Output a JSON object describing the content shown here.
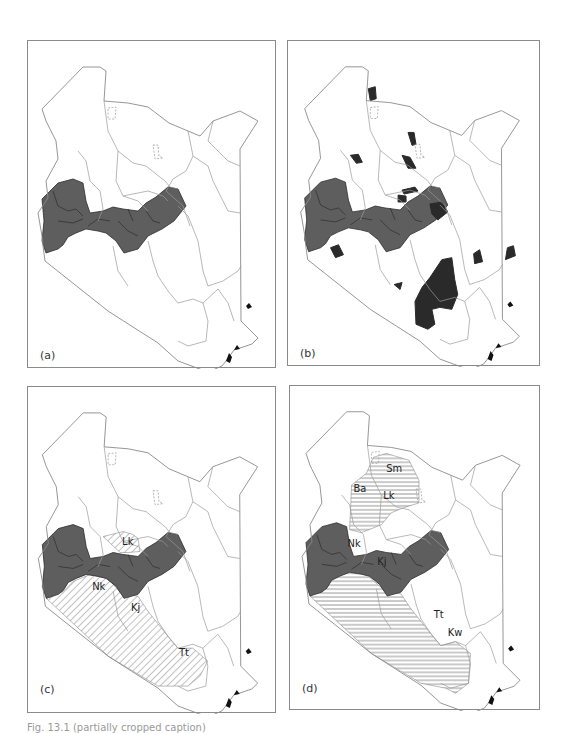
{
  "figure": {
    "colors": {
      "border_line": "#8a8a8a",
      "boundary_line": "#9a9a9a",
      "highland_fill": "#5e5e5e",
      "highland_line": "#2c2c2c",
      "dark_fill": "#2a2a2a",
      "hatch_line": "#666666",
      "coast_fill": "#111111"
    }
  },
  "panels": [
    {
      "id": "a",
      "label": "(a)",
      "shading": "highlands",
      "region_labels": []
    },
    {
      "id": "b",
      "label": "(b)",
      "shading": "highlands+dark-patches",
      "region_labels": []
    },
    {
      "id": "c",
      "label": "(c)",
      "shading": "highlands+diagonal-hatch",
      "region_labels": [
        {
          "text": "Lk",
          "x": 94,
          "y": 158
        },
        {
          "text": "Nk",
          "x": 64,
          "y": 204
        },
        {
          "text": "Kj",
          "x": 103,
          "y": 225
        },
        {
          "text": "Tt",
          "x": 151,
          "y": 264
        }
      ]
    },
    {
      "id": "d",
      "label": "(d)",
      "shading": "highlands+horizontal-hatch",
      "region_labels": [
        {
          "text": "Sm",
          "x": 95,
          "y": 87
        },
        {
          "text": "Ba",
          "x": 62,
          "y": 107
        },
        {
          "text": "Lk",
          "x": 92,
          "y": 114
        },
        {
          "text": "Nk",
          "x": 56,
          "y": 162
        },
        {
          "text": "Kj",
          "x": 86,
          "y": 181
        },
        {
          "text": "Tt",
          "x": 143,
          "y": 234
        },
        {
          "text": "Kw",
          "x": 157,
          "y": 252
        }
      ]
    }
  ],
  "caption": {
    "text": "Fig. 13.1 (partially cropped caption)"
  }
}
